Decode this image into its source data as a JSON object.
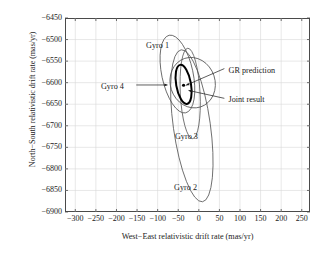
{
  "chart_data": {
    "type": "scatter",
    "title": "",
    "xlabel": "West−East relativistic drift rate (mas/yr)",
    "ylabel": "North−South relativistic drift rate (mas/yr)",
    "xlim": [
      -325,
      270
    ],
    "ylim": [
      -6900,
      -6450
    ],
    "xticks": [
      -300,
      -250,
      -200,
      -150,
      -100,
      -50,
      0,
      50,
      100,
      150,
      200,
      250
    ],
    "xticklabels": [
      "−300",
      "−250",
      "−200",
      "−150",
      "−100",
      "−50",
      "0",
      "50",
      "100",
      "150",
      "200",
      "250"
    ],
    "yticks": [
      -6450,
      -6500,
      -6550,
      -6600,
      -6650,
      -6700,
      -6750,
      -6800,
      -6850,
      -6900
    ],
    "yticklabels": [
      "−6450",
      "−6500",
      "−6550",
      "−6600",
      "−6650",
      "−6700",
      "−6750",
      "−6800",
      "−6850",
      "−6900"
    ],
    "grid": true,
    "legend": "none",
    "ellipses": [
      {
        "name": "Gyro 1",
        "cx": -52,
        "cy": -6580,
        "rx": 38,
        "ry": 92,
        "angle": -12,
        "stroke": "#555555",
        "width": 0.8
      },
      {
        "name": "Gyro 2",
        "cx": -17,
        "cy": -6700,
        "rx": 45,
        "ry": 178,
        "angle": -8,
        "stroke": "#555555",
        "width": 0.8
      },
      {
        "name": "Gyro 3",
        "cx": -21,
        "cy": -6625,
        "rx": 24,
        "ry": 105,
        "angle": -3,
        "stroke": "#555555",
        "width": 0.8
      },
      {
        "name": "Gyro 4",
        "cx": -15,
        "cy": -6600,
        "rx": 62,
        "ry": 52,
        "angle": 72,
        "stroke": "#555555",
        "width": 0.8
      },
      {
        "name": "Joint result",
        "cx": -37,
        "cy": -6604,
        "rx": 18,
        "ry": 46,
        "angle": -10,
        "stroke": "#000000",
        "width": 2.0
      }
    ],
    "points": [
      {
        "name": "GR prediction",
        "x": -37,
        "y": -6606,
        "marker": "dot",
        "color": "#000000"
      }
    ],
    "annotations": [
      {
        "label": "Gyro 1",
        "x": -128,
        "y": -6516,
        "leader": false
      },
      {
        "label": "Gyro 2",
        "x": -60,
        "y": -6845,
        "leader": false
      },
      {
        "label": "Gyro 3",
        "x": -58,
        "y": -6727,
        "leader": false
      },
      {
        "label": "Gyro 4",
        "x": -182,
        "y": -6610,
        "leader": true
      },
      {
        "label": "GR prediction",
        "x": 72,
        "y": -6572,
        "leader": true
      },
      {
        "label": "Joint result",
        "x": 72,
        "y": -6641,
        "leader": true
      }
    ]
  },
  "axis": {
    "xlabel": "West−East relativistic drift rate (mas/yr)",
    "ylabel": "North−South relativistic drift rate (mas/yr)"
  },
  "labels": {
    "gyro1": "Gyro 1",
    "gyro2": "Gyro 2",
    "gyro3": "Gyro 3",
    "gyro4": "Gyro 4",
    "gr_prediction": "GR prediction",
    "joint_result": "Joint result"
  },
  "colors": {
    "axis": "#4a4a4a",
    "grid": "#d8d8d8",
    "ellipse": "#555555",
    "joint": "#000000",
    "text": "#1a1a1a"
  }
}
